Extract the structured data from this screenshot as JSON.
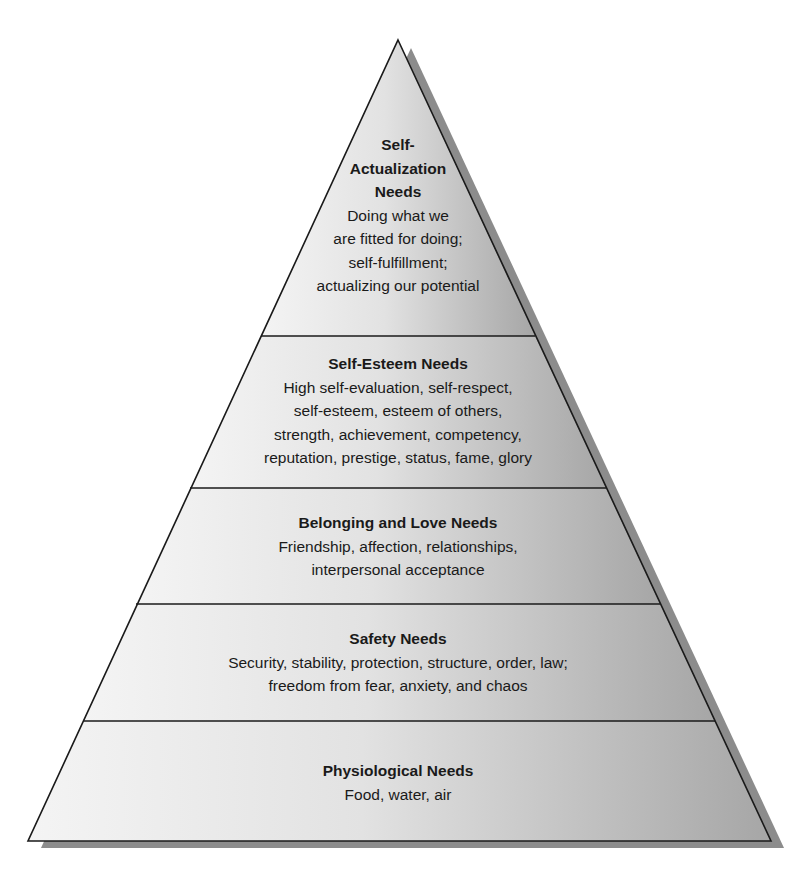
{
  "diagram": {
    "type": "pyramid",
    "colors": {
      "fill_light": "#f2f2f2",
      "fill_dark": "#a9a9a9",
      "shadow": "#8c8c8c",
      "stroke": "#1a1a1a",
      "background": "#ffffff"
    },
    "levels": [
      {
        "title_lines": [
          "Self-",
          "Actualization",
          "Needs"
        ],
        "description_lines": [
          "Doing what we",
          "are fitted for doing;",
          "self-fulfillment;",
          "actualizing our potential"
        ]
      },
      {
        "title_lines": [
          "Self-Esteem Needs"
        ],
        "description_lines": [
          "High self-evaluation, self-respect,",
          "self-esteem, esteem of others,",
          "strength, achievement, competency,",
          "reputation, prestige, status, fame, glory"
        ]
      },
      {
        "title_lines": [
          "Belonging and Love Needs"
        ],
        "description_lines": [
          "Friendship, affection, relationships,",
          "interpersonal acceptance"
        ]
      },
      {
        "title_lines": [
          "Safety Needs"
        ],
        "description_lines": [
          "Security, stability, protection, structure, order, law;",
          "freedom from fear, anxiety, and chaos"
        ]
      },
      {
        "title_lines": [
          "Physiological Needs"
        ],
        "description_lines": [
          "Food, water, air"
        ]
      }
    ]
  }
}
